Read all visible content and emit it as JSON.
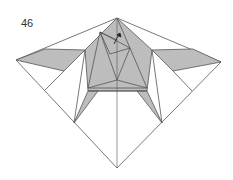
{
  "diagram": {
    "step_number": "46",
    "type": "origami-folding-step",
    "colors": {
      "paper_colored": "#bdbdbd",
      "paper_white": "#ffffff",
      "line": "#555555"
    },
    "symbols": [
      "fold-arrow"
    ]
  }
}
